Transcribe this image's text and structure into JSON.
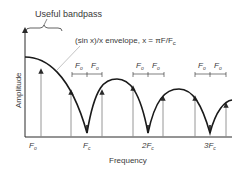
{
  "figure": {
    "bandpass_label": "Useful bandpass",
    "envelope_label": "(sin x)/x envelope, x = πF/F",
    "envelope_label_sub": "c",
    "y_axis_label": "Amplitude",
    "x_axis_label": "Frequency",
    "spacing_label": "F",
    "spacing_label_sub": "o",
    "x_ticks": [
      {
        "main": "F",
        "sub": "o"
      },
      {
        "main": "F",
        "sub": "c"
      },
      {
        "main": "2F",
        "sub": "c"
      },
      {
        "main": "3F",
        "sub": "c"
      }
    ],
    "colors": {
      "envelope": "#1a1a1a",
      "axes": "#2a2a2a",
      "arrows": "#8a8a8a",
      "text": "#3a3a3a"
    }
  }
}
